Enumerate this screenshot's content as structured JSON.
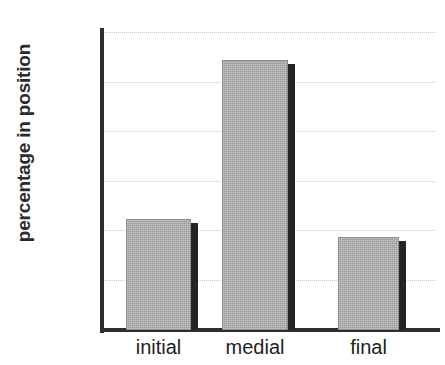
{
  "chart_data": {
    "type": "bar",
    "title": "",
    "xlabel": "",
    "ylabel": "percentage in position",
    "categories": [
      "initial",
      "medial",
      "final"
    ],
    "values": [
      22.5,
      54.5,
      18.7
    ],
    "ylim": [
      0,
      60
    ],
    "yticks": [
      0,
      10,
      20,
      30,
      40,
      50,
      60
    ],
    "ytick_labels": [
      "0",
      "10",
      "20",
      "30",
      "40",
      "50",
      "60"
    ],
    "grid": true,
    "legend": null,
    "series": [
      {
        "name": "percentage in position",
        "values": [
          22.5,
          54.5,
          18.7
        ]
      }
    ],
    "colors": {
      "bar_fill": "#ababab",
      "bar_edge": "#8d8d8d",
      "bar_shadow": "#242424",
      "axis": "#2e2e2e",
      "gridline": "#c9c9c9",
      "text": "#222222",
      "background": "#ffffff"
    }
  }
}
